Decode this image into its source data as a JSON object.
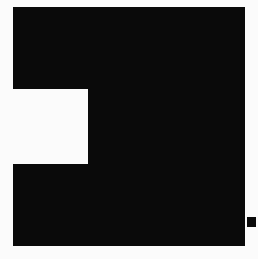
{
  "canvas": {
    "width": 258,
    "height": 259,
    "background_color": "#fbfbfb",
    "description": "Large solid black block with a rectangular notch cut into its left edge, plus a small detached black square near the bottom-right corner."
  },
  "shapes": {
    "main_block": {
      "label": "main-block",
      "fill_color": "#0a0a0a",
      "left": 13,
      "top": 7,
      "right": 245,
      "bottom": 246,
      "width": 232,
      "height": 239
    },
    "notch": {
      "label": "notch",
      "fill_color": "#fbfbfb",
      "left": 13,
      "top": 89,
      "right": 88,
      "bottom": 164,
      "width": 75,
      "height": 75
    },
    "corner_mark": {
      "label": "corner-mark",
      "fill_color": "#0a0a0a",
      "left": 247,
      "top": 217,
      "right": 256,
      "bottom": 227,
      "width": 9,
      "height": 10
    }
  },
  "geometry": {
    "main_block_outline_points": "13,7 245,7 245,246 13,246 13,164 88,164 88,89 13,89",
    "corner_mark_rect": {
      "x": 247,
      "y": 217,
      "width": 9,
      "height": 10
    }
  }
}
